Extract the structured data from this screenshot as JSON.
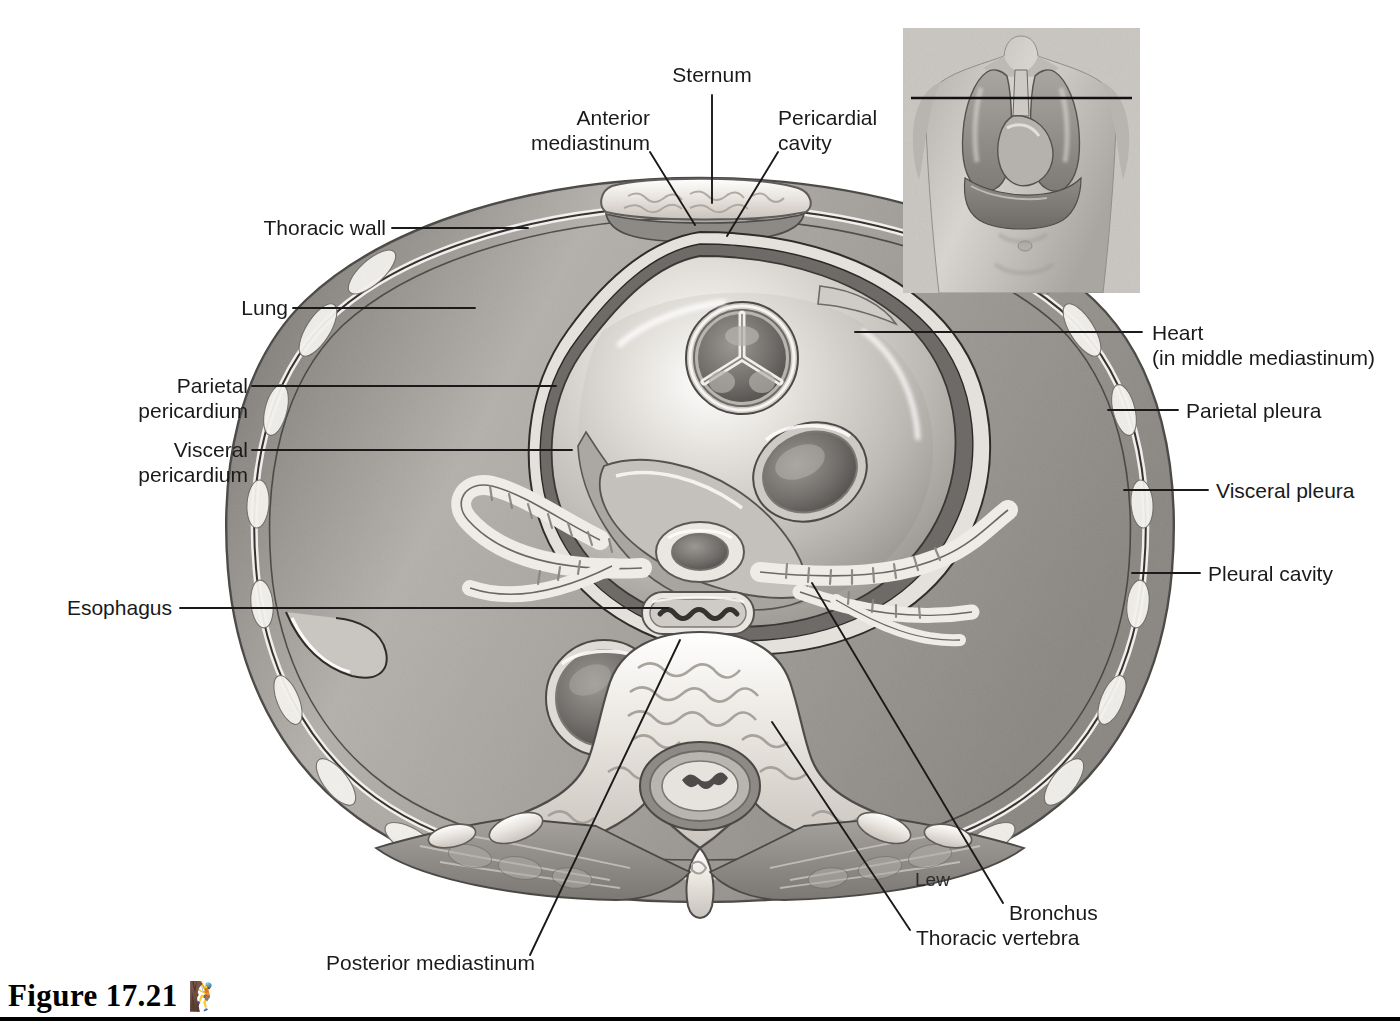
{
  "figure": {
    "caption": "Figure 17.21",
    "manikin_icon": "human-figure-icon",
    "artist_signature": "Lew"
  },
  "labels": [
    {
      "id": "sternum",
      "text": "Sternum",
      "align": "center"
    },
    {
      "id": "anterior-mediastinum",
      "text": "Anterior\nmediastinum",
      "align": "right"
    },
    {
      "id": "pericardial-cavity",
      "text": "Pericardial\ncavity",
      "align": "left"
    },
    {
      "id": "thoracic-wall",
      "text": "Thoracic wall",
      "align": "right"
    },
    {
      "id": "lung",
      "text": "Lung",
      "align": "right"
    },
    {
      "id": "parietal-pericardium",
      "text": "Parietal\npericardium",
      "align": "right"
    },
    {
      "id": "visceral-pericardium",
      "text": "Visceral\npericardium",
      "align": "right"
    },
    {
      "id": "esophagus",
      "text": "Esophagus",
      "align": "right"
    },
    {
      "id": "heart",
      "text": "Heart\n(in middle mediastinum)",
      "align": "left"
    },
    {
      "id": "parietal-pleura",
      "text": "Parietal pleura",
      "align": "left"
    },
    {
      "id": "visceral-pleura",
      "text": "Visceral pleura",
      "align": "left"
    },
    {
      "id": "pleural-cavity",
      "text": "Pleural cavity",
      "align": "left"
    },
    {
      "id": "bronchus",
      "text": "Bronchus",
      "align": "left"
    },
    {
      "id": "thoracic-vertebra",
      "text": "Thoracic vertebra",
      "align": "left"
    },
    {
      "id": "posterior-mediastinum",
      "text": "Posterior mediastinum",
      "align": "left"
    }
  ],
  "inset": {
    "name": "orientation-inset",
    "description": "Anterior view of male torso showing lungs, heart and diaphragm with a horizontal line marking the level of the section"
  },
  "colors": {
    "background": "#ffffff",
    "leader_line": "#1a1a1a",
    "label_text": "#1a1a1a",
    "lung_tissue": "#9a9a9a",
    "lung_tissue_dark": "#828282",
    "bone_light": "#f2f0ec",
    "bone_mid": "#d8d4ce",
    "soft_tissue": "#b9b5b0",
    "muscle": "#8f8b86",
    "cavity_dark": "#5e5c5a",
    "highlight": "#ffffff",
    "inset_bg": "#c9c6c1",
    "rule": "#000000"
  }
}
